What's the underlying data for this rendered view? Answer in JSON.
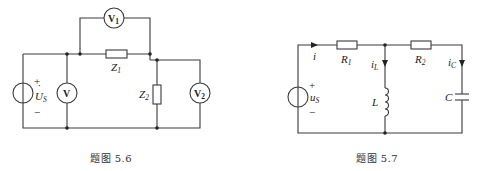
{
  "figures": [
    {
      "id": "5.6",
      "caption": "题图 5.6",
      "components": {
        "source": {
          "symbol": "U",
          "dot": "·",
          "subscript": "S",
          "plus": "+",
          "minus": "−"
        },
        "voltmeter_main": {
          "label": "V"
        },
        "voltmeter_1": {
          "label": "V",
          "subscript": "1"
        },
        "voltmeter_2": {
          "label": "V",
          "subscript": "2"
        },
        "impedance_1": {
          "label": "Z",
          "subscript": "1"
        },
        "impedance_2": {
          "label": "Z",
          "subscript": "2"
        }
      }
    },
    {
      "id": "5.7",
      "caption": "题图 5.7",
      "components": {
        "source": {
          "symbol": "u",
          "subscript": "S",
          "plus": "+",
          "minus": "−"
        },
        "current_main": {
          "label": "i"
        },
        "resistor_1": {
          "label": "R",
          "subscript": "1"
        },
        "resistor_2": {
          "label": "R",
          "subscript": "2"
        },
        "current_L": {
          "label": "i",
          "subscript": "L"
        },
        "current_C": {
          "label": "i",
          "subscript": "C"
        },
        "inductor": {
          "label": "L"
        },
        "capacitor": {
          "label": "C"
        }
      }
    }
  ],
  "colors": {
    "wire": "#3a3a3a",
    "text": "#222222",
    "background": "#ffffff"
  }
}
